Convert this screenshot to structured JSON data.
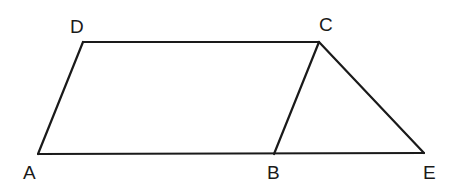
{
  "diagram": {
    "type": "geometry",
    "points": {
      "A": {
        "x": 38,
        "y": 154
      },
      "B": {
        "x": 274,
        "y": 154
      },
      "C": {
        "x": 319,
        "y": 42
      },
      "D": {
        "x": 83,
        "y": 42
      },
      "E": {
        "x": 424,
        "y": 153
      }
    },
    "segments": [
      [
        "A",
        "B"
      ],
      [
        "B",
        "E"
      ],
      [
        "A",
        "D"
      ],
      [
        "D",
        "C"
      ],
      [
        "C",
        "B"
      ],
      [
        "C",
        "E"
      ]
    ],
    "labels": {
      "A": "A",
      "B": "B",
      "C": "C",
      "D": "D",
      "E": "E"
    },
    "colors": {
      "stroke": "#1a1a1a",
      "background": "#ffffff"
    }
  }
}
